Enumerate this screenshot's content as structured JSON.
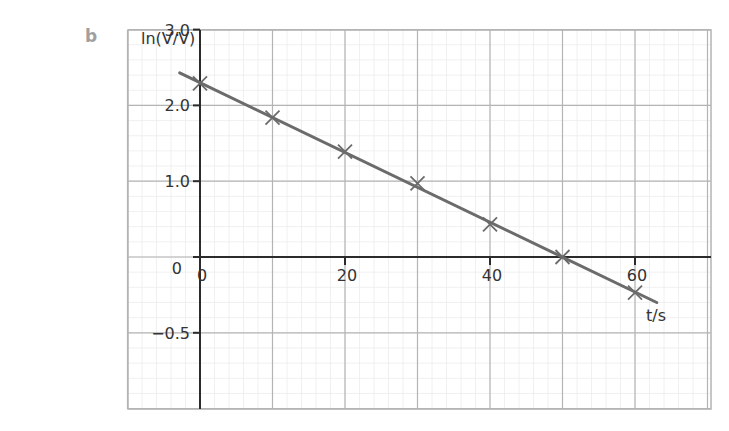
{
  "figure": {
    "part_label": "b"
  },
  "chart_data": {
    "type": "line",
    "title": "",
    "xlabel": "t/s",
    "ylabel": "ln(V₀/V)",
    "ylabel_display": "ln(V/V)",
    "xlim": [
      -10,
      70
    ],
    "ylim": [
      -2.0,
      3.0
    ],
    "x_ticks": [
      0,
      20,
      40,
      60
    ],
    "x_tick_labels": [
      "0",
      "20",
      "40",
      "60"
    ],
    "y_ticks": [
      3.0,
      2.0,
      1.0,
      0,
      -1.0
    ],
    "y_tick_labels": [
      "3.0",
      "2.0",
      "1.0",
      "0",
      "−0.5"
    ],
    "grid": true,
    "legend": null,
    "series": [
      {
        "name": "measured points",
        "marker": "x",
        "x": [
          0,
          10,
          20,
          30,
          40,
          50,
          60
        ],
        "y": [
          2.29,
          1.84,
          1.39,
          0.97,
          0.43,
          0.0,
          -0.47
        ]
      },
      {
        "name": "best-fit line",
        "style": "line",
        "x": [
          -2.8,
          63
        ],
        "y": [
          2.43,
          -0.6
        ]
      }
    ],
    "colors": {
      "line": "#6b6b6b",
      "marker": "#6b6b6b",
      "axes": "#2b2b2b",
      "major_grid": "#b4b4b4",
      "minor_grid": "#ececec"
    }
  }
}
